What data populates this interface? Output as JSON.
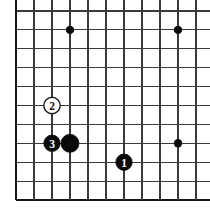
{
  "figure": {
    "board_type": "go-board-corner",
    "background_color": "#ffffff",
    "line_color": "#3a3a3a",
    "edge_color": "#151515",
    "black_stone_color": "#0a0a0a",
    "white_stone_color": "#ffffff"
  },
  "board": {
    "columns": 11,
    "rows": 11,
    "col_spacing": 18,
    "row_spacing": 18.9,
    "origin_x": 16,
    "origin_y": 11,
    "edges": {
      "left": true,
      "bottom": true,
      "top": false,
      "right": false
    },
    "star_points": [
      {
        "col": 3,
        "row": 1
      },
      {
        "col": 9,
        "row": 1
      },
      {
        "col": 9,
        "row": 7
      }
    ]
  },
  "stones": [
    {
      "label": "2",
      "color": "white",
      "col": 2,
      "row": 5,
      "radius": 8.2,
      "move_number": 2
    },
    {
      "label": "3",
      "color": "black",
      "col": 2,
      "row": 7,
      "radius": 8.2,
      "move_number": 3
    },
    {
      "label": "",
      "color": "black",
      "col": 3,
      "row": 7,
      "radius": 9.0,
      "move_number": null
    },
    {
      "label": "1",
      "color": "black",
      "col": 6,
      "row": 8,
      "radius": 8.2,
      "move_number": 1
    }
  ]
}
